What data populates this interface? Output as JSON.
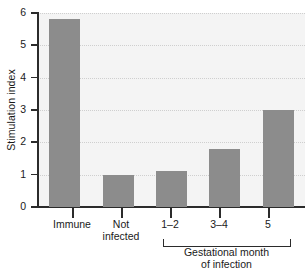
{
  "chart_data": {
    "type": "bar",
    "title": "",
    "xlabel": "",
    "ylabel": "Stimulation index",
    "categories": [
      "Immune",
      "Not infected",
      "1–2",
      "3–4",
      "5"
    ],
    "category_lines": [
      [
        "Immune"
      ],
      [
        "Not",
        "infected"
      ],
      [
        "1–2"
      ],
      [
        "3–4"
      ],
      [
        "5"
      ]
    ],
    "values": [
      5.8,
      1.0,
      1.1,
      1.8,
      3.0
    ],
    "ylim": [
      0,
      6
    ],
    "yticks": [
      0,
      1,
      2,
      3,
      4,
      5,
      6
    ],
    "ytick_labels": [
      "0",
      "1",
      "2",
      "3",
      "4",
      "5",
      "6"
    ],
    "grid": true,
    "grid_style": "dotted-horizontal",
    "legend": "none",
    "bar_color": "#8c8c8c",
    "axis_color": "#2b2b2b",
    "plot_background": "#f4f4f4",
    "page_background": "#ffffff",
    "group_bracket": {
      "label_lines": [
        "Gestational month",
        "of infection"
      ],
      "label": "Gestational month of infection",
      "spans_categories": [
        "1–2",
        "3–4",
        "5"
      ]
    }
  }
}
